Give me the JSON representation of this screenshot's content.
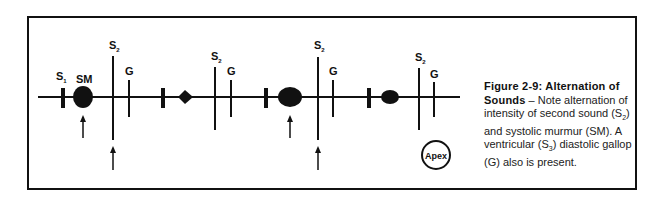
{
  "figure": {
    "caption_title": "Figure 2-9: Alternation of Sounds",
    "caption_dash": " – ",
    "caption_body_1": "Note alternation of intensity of second sound (S",
    "caption_sub_1": "2",
    "caption_body_2": ") and systolic murmur (SM). A ventricular (S",
    "caption_sub_2": "3",
    "caption_body_3": ") diastolic gallop (G) also is present."
  },
  "labels": {
    "s1": "S",
    "s1_sub": "1",
    "sm": "SM",
    "s2": "S",
    "s2_sub": "2",
    "g": "G",
    "apex": "Apex"
  },
  "cycles": [
    {
      "s1_x": 63,
      "murmur": "loud",
      "s2": "loud"
    },
    {
      "s1_x": 163,
      "murmur": "soft",
      "s2": "soft"
    },
    {
      "s1_x": 266,
      "murmur": "loud",
      "s2": "loud"
    },
    {
      "s1_x": 369,
      "murmur": "soft",
      "s2": "soft"
    }
  ]
}
